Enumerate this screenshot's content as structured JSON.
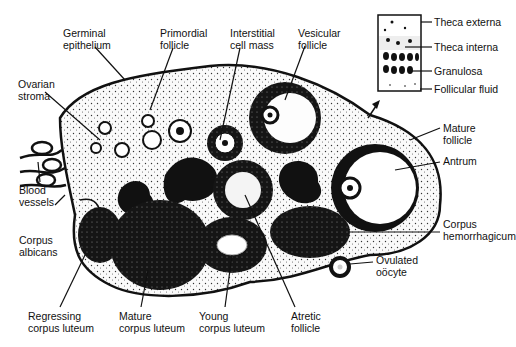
{
  "labels": {
    "germinal_epithelium": [
      "Germinal",
      "epithelium"
    ],
    "primordial_follicle": [
      "Primordial",
      "follicle"
    ],
    "interstitial_cell_mass": [
      "Interstitial",
      "cell mass"
    ],
    "vesicular_follicle": [
      "Vesicular",
      "follicle"
    ],
    "ovarian_stroma": [
      "Ovarian",
      "stroma"
    ],
    "blood_vessels": [
      "Blood",
      "vessels"
    ],
    "corpus_albicans": [
      "Corpus",
      "albicans"
    ],
    "mature_follicle": [
      "Mature",
      "follicle"
    ],
    "antrum": [
      "Antrum"
    ],
    "corpus_hemorrhagicum": [
      "Corpus",
      "hemorrhagicum"
    ],
    "ovulated_oocyte": [
      "Ovulated",
      "oöcyte"
    ],
    "regressing_corpus_luteum": [
      "Regressing",
      "corpus luteum"
    ],
    "mature_corpus_luteum": [
      "Mature",
      "corpus luteum"
    ],
    "young_corpus_luteum": [
      "Young",
      "corpus luteum"
    ],
    "atretic_follicle": [
      "Atretic",
      "follicle"
    ]
  },
  "inset": {
    "theca_externa": "Theca externa",
    "theca_interna": "Theca interna",
    "granulosa": "Granulosa",
    "follicular_fluid": "Follicular fluid"
  },
  "colors": {
    "ink": "#111111",
    "stroma": "#f2f2f2",
    "background": "#ffffff"
  }
}
